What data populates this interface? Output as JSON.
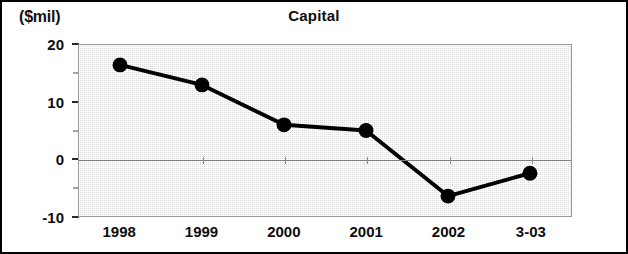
{
  "figure": {
    "unit_label": "($mil)",
    "title": "Capital"
  },
  "chart_data": {
    "type": "line",
    "title": "Capital",
    "subtitle": "",
    "xlabel": "",
    "ylabel": "($mil)",
    "ylim": [
      -10,
      20
    ],
    "xlim_categories": [
      "1998",
      "1999",
      "2000",
      "2001",
      "2002",
      "3-03"
    ],
    "categories": [
      "1998",
      "1999",
      "2000",
      "2001",
      "2002",
      "3-03"
    ],
    "values": [
      16.5,
      13,
      6,
      5,
      -6.5,
      -2.5
    ],
    "series": [
      {
        "name": "Capital",
        "values": [
          16.5,
          13,
          6,
          5,
          -6.5,
          -2.5
        ],
        "color": "#000000",
        "marker": "circle",
        "line_width": 4
      }
    ],
    "y_ticks_major": [
      20,
      10,
      0,
      -10
    ],
    "y_tick_labels": [
      "20",
      "10",
      "0",
      "-10"
    ],
    "y_ticks_minor": [
      15,
      5,
      -5
    ],
    "grid": false,
    "zero_line": true,
    "legend": false,
    "legend_position": "none",
    "plot_background": "#dcdcdc",
    "annotations": []
  }
}
